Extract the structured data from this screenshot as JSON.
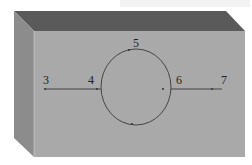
{
  "figure": {
    "colors": {
      "top_face": "#5a5a5a",
      "left_face": "#8c8c8c",
      "front_face": "#a9a9a9",
      "lines": "#3a3a3a",
      "labels": "#222222",
      "background": "#ffffff"
    },
    "points": [
      {
        "id": "p3",
        "label": "3",
        "x": 45,
        "y": 89,
        "label_x": 43,
        "label_y": 84
      },
      {
        "id": "p4",
        "label": "4",
        "x": 97,
        "y": 89,
        "label_x": 88,
        "label_y": 84
      },
      {
        "id": "p5",
        "label": "5",
        "x": 129,
        "y": 50,
        "label_x": 133,
        "label_y": 47
      },
      {
        "id": "p6",
        "label": "6",
        "x": 163,
        "y": 89,
        "label_x": 176,
        "label_y": 84
      },
      {
        "id": "p7",
        "label": "7",
        "x": 212,
        "y": 89,
        "label_x": 221,
        "label_y": 84
      }
    ],
    "extra_dots": [
      {
        "x": 132,
        "y": 124
      }
    ],
    "circle": {
      "cx": 136,
      "cy": 87,
      "rx": 35,
      "ry": 38
    },
    "segments": [
      {
        "from": "p3",
        "to": "p4",
        "x1": 45,
        "y1": 89,
        "x2": 101,
        "y2": 89
      },
      {
        "from": "p6",
        "to": "p7",
        "x1": 171,
        "y1": 89,
        "x2": 222,
        "y2": 89
      }
    ]
  }
}
